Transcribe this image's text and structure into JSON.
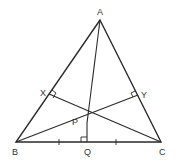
{
  "diagram": {
    "type": "geometry",
    "points": {
      "A": {
        "label": "A",
        "x": 100,
        "y": 20
      },
      "B": {
        "label": "B",
        "x": 16,
        "y": 142
      },
      "C": {
        "label": "C",
        "x": 161,
        "y": 142
      },
      "X": {
        "label": "X",
        "x": 49,
        "y": 94
      },
      "Y": {
        "label": "Y",
        "x": 138,
        "y": 95
      },
      "P": {
        "label": "P",
        "x": 87,
        "y": 123
      },
      "Q": {
        "label": "Q",
        "x": 87,
        "y": 142
      }
    },
    "segments": [
      "AB",
      "BC",
      "CA",
      "AP",
      "PQ",
      "PX",
      "PY",
      "PB",
      "PC"
    ],
    "right_angles": [
      "X",
      "Y",
      "Q"
    ],
    "equal_marks": [
      "BQ",
      "QC"
    ],
    "stroke_color": "#2a2a2a",
    "label_color": "#333333"
  }
}
